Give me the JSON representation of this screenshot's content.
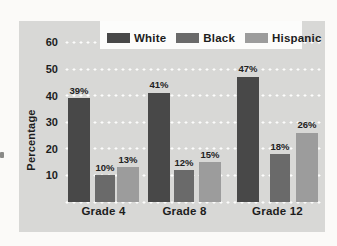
{
  "chart_data": {
    "type": "bar",
    "title": "",
    "categories": [
      "Grade 4",
      "Grade 8",
      "Grade 12"
    ],
    "series": [
      {
        "name": "White",
        "values": [
          39,
          41,
          47
        ],
        "color": "#484848"
      },
      {
        "name": "Black",
        "values": [
          10,
          12,
          18
        ],
        "color": "#6a6a6a"
      },
      {
        "name": "Hispanic",
        "values": [
          13,
          15,
          26
        ],
        "color": "#9c9c9c"
      }
    ],
    "value_labels": [
      [
        "39%",
        "41%",
        "47%"
      ],
      [
        "10%",
        "12%",
        "18%"
      ],
      [
        "13%",
        "15%",
        "26%"
      ]
    ],
    "ylabel": "Percentage",
    "yticks": [
      10,
      20,
      30,
      40,
      50,
      60
    ],
    "ylim": [
      0,
      65
    ],
    "grid": "horizontal white dotted lines every 10 units, including baseline",
    "legend_position": "top"
  },
  "colors": {
    "page_bg": "#fbfaf8",
    "panel_bg": "#d8d8d6",
    "legend_bg": "#fcfcfb",
    "text": "#1d1d1d",
    "grid_dots": "#ffffff"
  }
}
